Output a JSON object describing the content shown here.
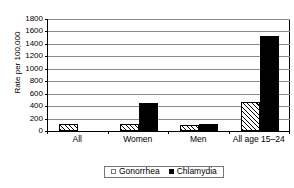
{
  "chart_data": {
    "type": "bar",
    "title": "",
    "xlabel": "",
    "ylabel": "Rate per 100,000",
    "ylim": [
      0,
      1800
    ],
    "ytick_step": 200,
    "yticks": [
      "1800",
      "1600",
      "1400",
      "1200",
      "1000",
      "800",
      "600",
      "400",
      "200",
      "0"
    ],
    "grid": true,
    "legend_position": "bottom",
    "categories": [
      "All",
      "Women",
      "Men",
      "All age 15–24"
    ],
    "series": [
      {
        "name": "Gonorrhea",
        "marker": "hatched-square",
        "color": "#ffffff",
        "values": [
          120,
          105,
          100,
          460
        ]
      },
      {
        "name": "Chlamydia",
        "marker": "filled-square",
        "color": "#000000",
        "values": [
          0,
          455,
          115,
          1530
        ]
      }
    ]
  },
  "legend": {
    "items": [
      {
        "label": "Gonorrhea"
      },
      {
        "label": "Chlamydia"
      }
    ]
  }
}
